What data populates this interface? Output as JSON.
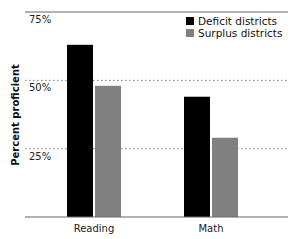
{
  "chart_data": {
    "type": "bar",
    "title": "",
    "xlabel": "",
    "ylabel": "Percent proficient",
    "categories": [
      "Reading",
      "Math"
    ],
    "series": [
      {
        "name": "Deficit districts",
        "color": "#000000",
        "values": [
          63,
          44
        ]
      },
      {
        "name": "Surplus districts",
        "color": "#808080",
        "values": [
          48,
          29
        ]
      }
    ],
    "yticks": [
      {
        "value": 25,
        "label": "25%"
      },
      {
        "value": 50,
        "label": "50%"
      },
      {
        "value": 75,
        "label": "75%"
      }
    ],
    "ylim": [
      0,
      75
    ],
    "grid": "dotted at 25% and 50%",
    "legend_position": "top-right"
  }
}
